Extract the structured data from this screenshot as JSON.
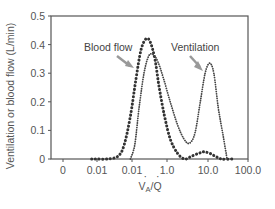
{
  "chart_data": {
    "type": "line",
    "title": "",
    "xlabel": "V̇A/Q̇",
    "ylabel": "Ventilation or blood flow (L/min)",
    "xscale": "log",
    "x_tick_labels": [
      "0",
      "0.01",
      "0.01",
      "1.0",
      "10.0",
      "100.0"
    ],
    "y_tick_labels": [
      "0",
      "0.1",
      "0.2",
      "0.3",
      "0.4",
      "0.5"
    ],
    "ylim": [
      0,
      0.5
    ],
    "grid": false,
    "legend": "inline annotations with arrows",
    "series": [
      {
        "name": "Blood flow",
        "style": "dotted (large dots)",
        "points": [
          [
            0.007,
            0.0
          ],
          [
            0.01,
            0.0
          ],
          [
            0.02,
            0.0
          ],
          [
            0.04,
            0.01
          ],
          [
            0.06,
            0.05
          ],
          [
            0.09,
            0.15
          ],
          [
            0.13,
            0.28
          ],
          [
            0.18,
            0.38
          ],
          [
            0.25,
            0.42
          ],
          [
            0.33,
            0.41
          ],
          [
            0.45,
            0.35
          ],
          [
            0.6,
            0.25
          ],
          [
            0.85,
            0.15
          ],
          [
            1.2,
            0.07
          ],
          [
            1.8,
            0.02
          ],
          [
            2.7,
            0.0
          ],
          [
            4,
            0.01
          ],
          [
            6,
            0.02
          ],
          [
            8,
            0.025
          ],
          [
            11,
            0.02
          ],
          [
            15,
            0.01
          ],
          [
            22,
            0.0
          ],
          [
            40,
            0.0
          ]
        ]
      },
      {
        "name": "Ventilation",
        "style": "dotted (fine dots)",
        "points": [
          [
            0.09,
            0.0
          ],
          [
            0.12,
            0.05
          ],
          [
            0.16,
            0.18
          ],
          [
            0.22,
            0.3
          ],
          [
            0.3,
            0.36
          ],
          [
            0.4,
            0.365
          ],
          [
            0.55,
            0.34
          ],
          [
            0.8,
            0.28
          ],
          [
            1.2,
            0.2
          ],
          [
            1.8,
            0.12
          ],
          [
            2.6,
            0.07
          ],
          [
            3.5,
            0.055
          ],
          [
            4.8,
            0.09
          ],
          [
            6.5,
            0.2
          ],
          [
            8.5,
            0.3
          ],
          [
            11,
            0.335
          ],
          [
            14,
            0.3
          ],
          [
            18,
            0.18
          ],
          [
            24,
            0.08
          ],
          [
            30,
            0.0
          ]
        ]
      }
    ],
    "annotations": [
      {
        "text": "Blood flow",
        "points_to": "Blood flow"
      },
      {
        "text": "Ventilation",
        "points_to": "Ventilation"
      }
    ]
  }
}
